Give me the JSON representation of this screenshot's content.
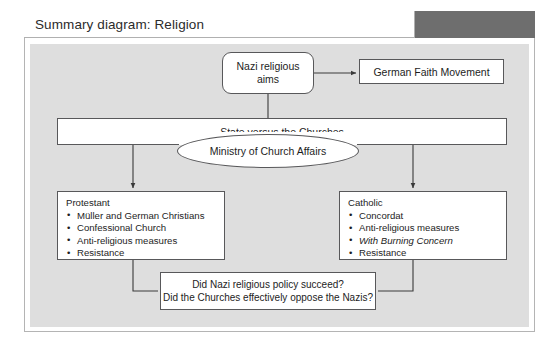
{
  "header": {
    "title": "Summary diagram: Religion",
    "accent_block_color": "#6e6e6e"
  },
  "canvas": {
    "background_color": "#dedede"
  },
  "diagram": {
    "type": "flowchart",
    "nodes": {
      "aims": {
        "label": "Nazi religious aims",
        "line1": "Nazi religious",
        "line2": "aims",
        "shape": "rounded-rect"
      },
      "german_faith_movement": {
        "label": "German Faith Movement",
        "shape": "rect"
      },
      "state_vs_churches": {
        "label": "State versus the Churches",
        "shape": "rect"
      },
      "ministry": {
        "label": "Ministry of Church Affairs",
        "shape": "ellipse"
      },
      "protestant": {
        "heading": "Protestant",
        "items": [
          {
            "text": "Müller and German Christians",
            "italic": false
          },
          {
            "text": "Confessional Church",
            "italic": false
          },
          {
            "text": "Anti-religious measures",
            "italic": false
          },
          {
            "text": "Resistance",
            "italic": false
          }
        ]
      },
      "catholic": {
        "heading": "Catholic",
        "items": [
          {
            "text": "Concordat",
            "italic": false
          },
          {
            "text": "Anti-religious measures",
            "italic": false
          },
          {
            "text": "With Burning Concern",
            "italic": true
          },
          {
            "text": "Resistance",
            "italic": false
          }
        ]
      },
      "questions": {
        "line1": "Did Nazi religious policy succeed?",
        "line2": "Did the Churches effectively oppose the Nazis?"
      }
    },
    "edges": [
      {
        "from": "aims",
        "to": "german_faith_movement",
        "arrow": true
      },
      {
        "from": "aims",
        "to": "state_vs_churches",
        "arrow": false
      },
      {
        "from": "state_vs_churches",
        "to": "protestant",
        "arrow": true
      },
      {
        "from": "state_vs_churches",
        "to": "catholic",
        "arrow": true
      },
      {
        "from": "protestant",
        "to": "questions",
        "arrow": false
      },
      {
        "from": "catholic",
        "to": "questions",
        "arrow": false
      }
    ]
  }
}
